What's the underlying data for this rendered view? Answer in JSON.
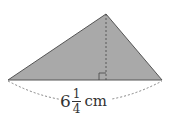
{
  "diagram": {
    "shape": "triangle",
    "fill_color": "#a9a9a9",
    "stroke_color": "#555555",
    "vertices": {
      "left": [
        8,
        80
      ],
      "apex": [
        106,
        14
      ],
      "right": [
        162,
        80
      ]
    },
    "height_line": "dashed",
    "right_angle_marker": true,
    "base_label": {
      "whole": "6",
      "numerator": "1",
      "denominator": "4",
      "unit": "cm"
    }
  }
}
